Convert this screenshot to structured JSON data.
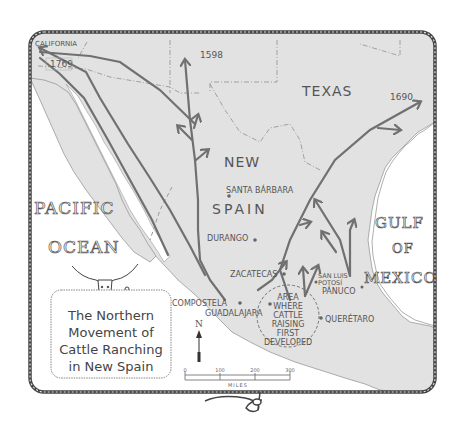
{
  "map": {
    "title_lines": [
      "The Northern",
      "Movement of",
      "Cattle Ranching",
      "in New Spain"
    ],
    "regions": {
      "california": "CALIFORNIA",
      "texas": "TEXAS",
      "new": "NEW",
      "spain": "SPAIN"
    },
    "water": {
      "pacific": "PACIFIC",
      "ocean": "OCEAN",
      "gulf": "GULF",
      "of": "OF",
      "mexico": "MEXICO"
    },
    "dates": {
      "d1769": "1769",
      "d1598": "1598",
      "d1690": "1690"
    },
    "cities": {
      "santa_barbara": "SANTA BÁRBARA",
      "durango": "DURANGO",
      "zacatecas": "ZACATECAS",
      "san_luis": "SAN LUIS",
      "potosi": "POTOSÍ",
      "panuco": "PÁNUCO",
      "compostela": "COMPOSTELA",
      "guadalajara": "GUADALAJARA",
      "queretaro": "QUERÉTARO"
    },
    "origin_area": [
      "AREA",
      "WHERE",
      "CATTLE",
      "RAISING",
      "FIRST",
      "DEVELOPED"
    ],
    "compass": "N",
    "scale": {
      "ticks": [
        "0",
        "100",
        "200",
        "300"
      ],
      "unit": "MILES"
    },
    "colors": {
      "land": "#e2e2e2",
      "water": "#ffffff",
      "routes": "#707070",
      "border": "#555555"
    }
  }
}
